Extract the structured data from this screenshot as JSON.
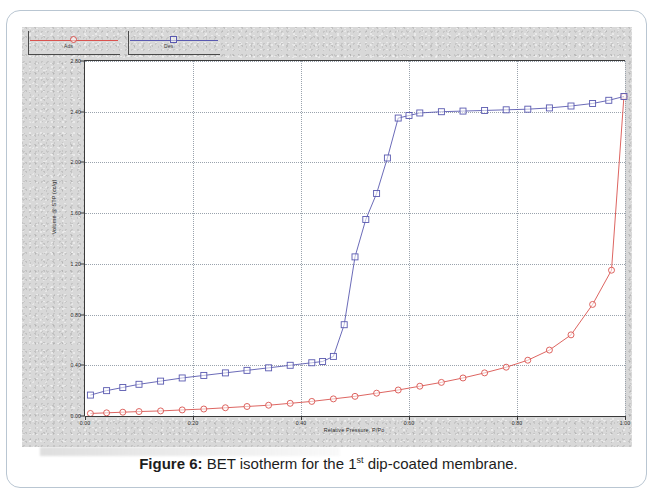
{
  "caption": {
    "prefix": "Figure 6:",
    "text_before_sup": " BET isotherm for the 1",
    "superscript": "st",
    "text_after_sup": " dip-coated membrane."
  },
  "legend": {
    "entries": [
      {
        "label": "Ads",
        "color": "#d9534f",
        "marker": "circle"
      },
      {
        "label": "Des",
        "color": "#5a5ab0",
        "marker": "square"
      }
    ]
  },
  "axes": {
    "x_title": "Relative Pressure, P/Po",
    "y_title": "Volume @ STP (cc/g)",
    "x_ticks": [
      "0.00",
      "0.20",
      "0.40",
      "0.60",
      "0.80",
      "1.00"
    ],
    "y_ticks": [
      "2.80",
      "2.40",
      "2.00",
      "1.60",
      "1.20",
      "0.80",
      "0.40",
      "0.00"
    ]
  },
  "chart_data": {
    "type": "line",
    "title": "BET isotherm for the 1st dip-coated membrane",
    "xlabel": "Relative Pressure, P/Po",
    "ylabel": "Volume @ STP (cc/g)",
    "xlim": [
      0.0,
      1.0
    ],
    "ylim": [
      0.0,
      2.8
    ],
    "xticks": [
      0.0,
      0.2,
      0.4,
      0.6,
      0.8,
      1.0
    ],
    "yticks": [
      0.0,
      0.4,
      0.8,
      1.2,
      1.6,
      2.0,
      2.4,
      2.8
    ],
    "grid": true,
    "legend_position": "above-plot-left",
    "series": [
      {
        "name": "Ads",
        "color": "#d9534f",
        "marker": "circle",
        "x": [
          0.01,
          0.04,
          0.07,
          0.1,
          0.14,
          0.18,
          0.22,
          0.26,
          0.3,
          0.34,
          0.38,
          0.42,
          0.46,
          0.5,
          0.54,
          0.58,
          0.62,
          0.66,
          0.7,
          0.74,
          0.78,
          0.82,
          0.86,
          0.9,
          0.94,
          0.975,
          0.998
        ],
        "y": [
          0.02,
          0.025,
          0.03,
          0.035,
          0.04,
          0.048,
          0.055,
          0.065,
          0.075,
          0.085,
          0.1,
          0.115,
          0.135,
          0.155,
          0.18,
          0.205,
          0.235,
          0.265,
          0.3,
          0.34,
          0.385,
          0.44,
          0.52,
          0.64,
          0.88,
          1.15,
          2.52
        ]
      },
      {
        "name": "Des",
        "color": "#5a5ab0",
        "marker": "square",
        "x": [
          0.01,
          0.04,
          0.07,
          0.1,
          0.14,
          0.18,
          0.22,
          0.26,
          0.3,
          0.34,
          0.38,
          0.42,
          0.44,
          0.46,
          0.48,
          0.5,
          0.52,
          0.54,
          0.56,
          0.58,
          0.6,
          0.62,
          0.66,
          0.7,
          0.74,
          0.78,
          0.82,
          0.86,
          0.9,
          0.94,
          0.97,
          0.998
        ],
        "y": [
          0.165,
          0.2,
          0.225,
          0.25,
          0.275,
          0.3,
          0.32,
          0.34,
          0.36,
          0.38,
          0.4,
          0.42,
          0.43,
          0.47,
          0.72,
          1.255,
          1.55,
          1.755,
          2.035,
          2.35,
          2.37,
          2.39,
          2.4,
          2.405,
          2.41,
          2.415,
          2.42,
          2.43,
          2.445,
          2.465,
          2.49,
          2.52
        ]
      }
    ]
  }
}
